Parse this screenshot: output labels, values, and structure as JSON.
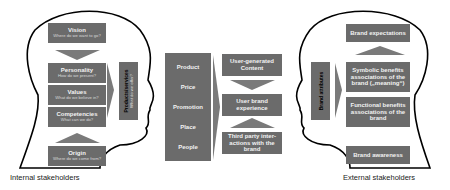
{
  "internal": {
    "caption": "Internal stakeholders",
    "vision": {
      "title": "Vision",
      "sub": "Where do we want to go?"
    },
    "personality": {
      "title": "Personality",
      "sub": "How do we present?"
    },
    "values": {
      "title": "Values",
      "sub": "What do we believe in?"
    },
    "competencies": {
      "title": "Competencies",
      "sub": "What can we do?"
    },
    "origin": {
      "title": "Origin",
      "sub": "Where do we come from?"
    },
    "products": {
      "title": "Products/services",
      "sub": "What do we offer?"
    }
  },
  "marketing_mix": {
    "items": [
      "Product",
      "Price",
      "Promotion",
      "Place",
      "People"
    ]
  },
  "experience": {
    "ugc": "User-generated Content",
    "user_brand": "User brand experience",
    "third_party": "Third party inter-actions with the brand"
  },
  "external": {
    "caption": "External stakeholders",
    "attributes": "Brand attributes",
    "expectations": "Brand expectations",
    "symbolic": "Symbolic benefits associations of the brand („meaning“)",
    "functional": "Functional benefits associations of the brand",
    "awareness": "Brand awareness"
  },
  "colors": {
    "box": "#6b6b6b",
    "outline": "#000000",
    "arrow": "#7a7a7a"
  }
}
